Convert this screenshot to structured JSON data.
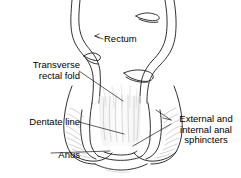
{
  "figure": {
    "type": "anatomical-line-drawing",
    "width": 241,
    "height": 178,
    "background_color": "#ffffff",
    "line_color": "#1a1a1a",
    "shading_color": "#9a9a9a",
    "text_color": "#000000"
  },
  "labels": {
    "rectum": {
      "text": "Rectum",
      "align": "left",
      "lines": [
        "Rectum"
      ]
    },
    "transverse_rectal_fold": {
      "text": "Transverse\nrectal fold",
      "align": "right",
      "lines": [
        "Transverse",
        "rectal fold"
      ]
    },
    "dentate_line": {
      "text": "Dentate line",
      "align": "right",
      "lines": [
        "Dentate line"
      ]
    },
    "anus": {
      "text": "Anus",
      "align": "right",
      "lines": [
        "Anus"
      ]
    },
    "sphincters": {
      "text": "External and\ninternal anal\nsphincters",
      "align": "center",
      "lines": [
        "External and",
        "internal anal",
        "sphincters"
      ]
    }
  },
  "structures": [
    "rectal wall",
    "transverse rectal fold",
    "anal canal",
    "anal columns",
    "dentate line",
    "internal anal sphincter",
    "external anal sphincter",
    "anus"
  ]
}
